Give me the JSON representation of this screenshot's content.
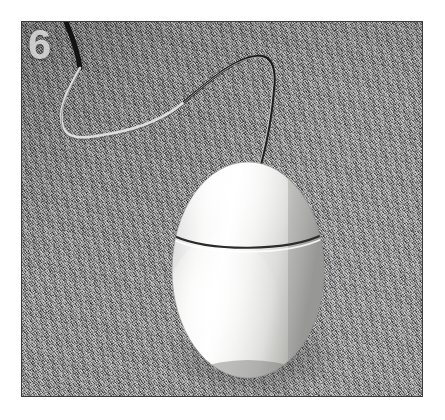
{
  "image": {
    "index_label": "6",
    "subject": "white egg-shaped corded computer mouse",
    "background_surface": "gray stucco concrete texture",
    "frame": {
      "outer_background_color": "#ffffff",
      "border_color": "#3a3a3a",
      "photo_left": 21,
      "photo_top": 21,
      "photo_width": 402,
      "photo_height": 376
    },
    "colors": {
      "surface_base": "#8e8e8e",
      "surface_light": "#c8c8c8",
      "surface_dark": "#4e4e4e",
      "mouse_highlight": "#ffffff",
      "mouse_body": "#e8e8e6",
      "mouse_shadow": "#9c9c9a",
      "seam_line": "#2e2e2e",
      "cable_dark": "#141414",
      "cable_light": "#dcdcdc",
      "number_color": "#eeeeee"
    },
    "objects": {
      "mouse": {
        "name": "egg-mouse",
        "center_x": 247,
        "center_y": 269,
        "radius_x": 76,
        "radius_y": 108,
        "seam_y": 241
      },
      "cable": {
        "name": "mouse-cable",
        "entry_x": 65,
        "entry_y": 21,
        "connect_x": 258,
        "connect_y": 162
      }
    }
  }
}
